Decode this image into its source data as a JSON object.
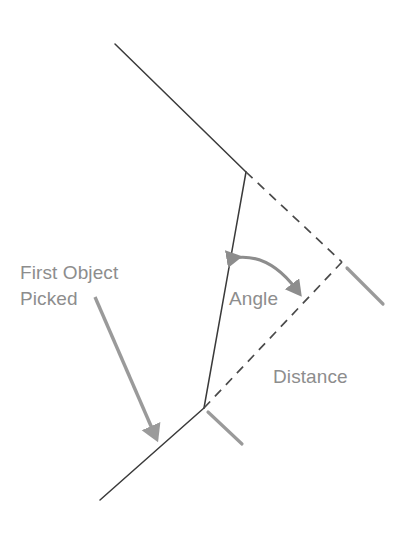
{
  "diagram": {
    "background_color": "#ffffff",
    "line_color": "#3a3a3a",
    "annotation_color": "#8d8d8d",
    "labels": {
      "first_object_line1": "First Object",
      "first_object_line2": "Picked",
      "angle": "Angle",
      "distance": "Distance"
    },
    "geometry": {
      "upper_line": {
        "from": [
          115,
          44
        ],
        "to": [
          246,
          172
        ],
        "style": "solid",
        "name": "upper-solid-line"
      },
      "connector_line": {
        "from": [
          246,
          172
        ],
        "to": [
          204,
          408
        ],
        "style": "solid",
        "name": "connector-solid-line"
      },
      "lower_line": {
        "from": [
          204,
          408
        ],
        "to": [
          100,
          500
        ],
        "style": "solid",
        "name": "lower-solid-line"
      },
      "dashed_upper": {
        "from": [
          246,
          172
        ],
        "to": [
          342,
          262
        ],
        "style": "dashed",
        "name": "dashed-upper-leg"
      },
      "dashed_lower": {
        "from": [
          342,
          262
        ],
        "to": [
          204,
          408
        ],
        "style": "dashed",
        "name": "dashed-lower-leg"
      },
      "tick_right": {
        "from": [
          347,
          268
        ],
        "to": [
          383,
          304
        ],
        "style": "solid-gray",
        "name": "right-tick-mark"
      },
      "tick_bottom": {
        "from": [
          208,
          412
        ],
        "to": [
          242,
          444
        ],
        "style": "solid-gray",
        "name": "bottom-tick-mark"
      },
      "angle_arc": {
        "from": [
          233,
          258
        ],
        "to": [
          296,
          289
        ],
        "control": [
          268,
          255
        ],
        "name": "angle-double-arrow-arc"
      },
      "callout_arrow": {
        "from": [
          95,
          297
        ],
        "to": [
          157,
          439
        ],
        "name": "first-object-callout-arrow"
      }
    },
    "label_positions": {
      "first_object_line1": [
        20,
        279
      ],
      "first_object_line2": [
        20,
        305
      ],
      "angle": [
        229,
        305
      ],
      "distance": [
        273,
        383
      ]
    }
  }
}
